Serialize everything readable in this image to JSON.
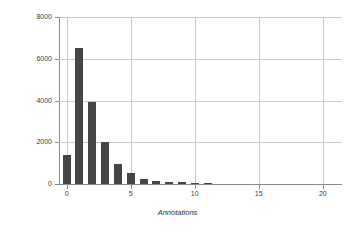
{
  "chart_data": {
    "type": "bar",
    "title": "",
    "subtitle": "",
    "xlabel": "Annotations",
    "ylabel": "Tweets",
    "categories": [
      0,
      1,
      2,
      3,
      4,
      5,
      6,
      7,
      8,
      9,
      10,
      11,
      12,
      13,
      14,
      15,
      16,
      17,
      18,
      19,
      20,
      21
    ],
    "values": [
      1400,
      6500,
      3950,
      2030,
      960,
      540,
      260,
      150,
      110,
      95,
      55,
      25,
      0,
      0,
      0,
      0,
      0,
      0,
      0,
      0,
      0,
      0
    ],
    "x": [
      0,
      1,
      2,
      3,
      4,
      5,
      6,
      7,
      8,
      9,
      10,
      11,
      12,
      13,
      14,
      15,
      16,
      17,
      18,
      19,
      20,
      21
    ],
    "xlim": [
      -0.6,
      21.5
    ],
    "ylim": [
      0,
      8000
    ],
    "xticks": [
      "0",
      "5",
      "10",
      "15",
      "20"
    ],
    "xtick_values": [
      0,
      5,
      10,
      15,
      20
    ],
    "yticks": [
      "0",
      "2000",
      "4000",
      "6000",
      "8000"
    ],
    "ytick_values": [
      0,
      2000,
      4000,
      6000,
      8000
    ],
    "grid": true,
    "legend": false,
    "bar_color": "#454545",
    "grid_color": "#c9c9c9",
    "axis_color": "#8a8a8a",
    "background": "#ffffff"
  }
}
